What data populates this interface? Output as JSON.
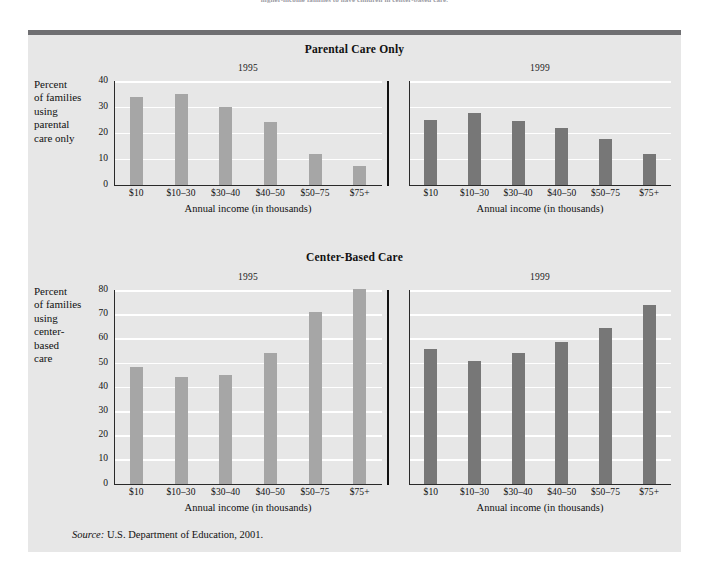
{
  "figure": {
    "top_caption": "higher-income families to have children in center-based care.",
    "source_prefix": "Source:",
    "source_text": "U.S. Department of Education, 2001."
  },
  "sections": [
    {
      "title": "Parental Care Only",
      "ylabel": "Percent\nof families\nusing\nparental\ncare only",
      "xlabel": "Annual income (in thousands)",
      "y_ticks": [
        "0",
        "10",
        "20",
        "30",
        "40"
      ],
      "panels": [
        {
          "year": "1995",
          "bar_color": "#a6a6a6"
        },
        {
          "year": "1999",
          "bar_color": "#777777"
        }
      ]
    },
    {
      "title": "Center-Based Care",
      "ylabel": "Percent\nof families\nusing\ncenter-\nbased\ncare",
      "xlabel": "Annual income (in thousands)",
      "y_ticks": [
        "0",
        "10",
        "20",
        "30",
        "40",
        "50",
        "60",
        "70",
        "80"
      ],
      "panels": [
        {
          "year": "1995",
          "bar_color": "#a6a6a6"
        },
        {
          "year": "1999",
          "bar_color": "#777777"
        }
      ]
    }
  ],
  "colors": {
    "panel_background": "#e7e7e7",
    "gridline": "#ffffff",
    "axis": "#2a2a2a",
    "bar_1995": "#a6a6a6",
    "bar_1999": "#777777",
    "rule_top": "#6f6f72"
  },
  "chart_data": [
    {
      "type": "bar",
      "title": "Parental Care Only",
      "subtitle": "1995",
      "xlabel": "Annual income (in thousands)",
      "ylabel": "Percent of families using parental care only",
      "categories": [
        "$10",
        "$10–30",
        "$30–40",
        "$40–50",
        "$50–75",
        "$75+"
      ],
      "values": [
        34,
        35,
        30,
        24,
        12,
        7
      ],
      "ylim": [
        0,
        40
      ],
      "ytick_step": 10,
      "grid": true,
      "legend": "none",
      "bar_color": "#a6a6a6"
    },
    {
      "type": "bar",
      "title": "Parental Care Only",
      "subtitle": "1999",
      "xlabel": "Annual income (in thousands)",
      "ylabel": "Percent of families using parental care only",
      "categories": [
        "$10",
        "$10–30",
        "$30–40",
        "$40–50",
        "$50–75",
        "$75+"
      ],
      "values": [
        25,
        27.5,
        24.5,
        22,
        17.5,
        12
      ],
      "ylim": [
        0,
        40
      ],
      "ytick_step": 10,
      "grid": true,
      "legend": "none",
      "bar_color": "#777777"
    },
    {
      "type": "bar",
      "title": "Center-Based Care",
      "subtitle": "1995",
      "xlabel": "Annual income (in thousands)",
      "ylabel": "Percent of families using center-based care",
      "categories": [
        "$10",
        "$10–30",
        "$30–40",
        "$40–50",
        "$50–75",
        "$75+"
      ],
      "values": [
        48,
        44,
        45,
        54,
        71,
        80.5
      ],
      "ylim": [
        0,
        80
      ],
      "ytick_step": 10,
      "grid": true,
      "legend": "none",
      "bar_color": "#a6a6a6"
    },
    {
      "type": "bar",
      "title": "Center-Based Care",
      "subtitle": "1999",
      "xlabel": "Annual income (in thousands)",
      "ylabel": "Percent of families using center-based care",
      "categories": [
        "$10",
        "$10–30",
        "$30–40",
        "$40–50",
        "$50–75",
        "$75+"
      ],
      "values": [
        55.5,
        50.5,
        54,
        58.5,
        64.5,
        74
      ],
      "ylim": [
        0,
        80
      ],
      "ytick_step": 10,
      "grid": true,
      "legend": "none",
      "bar_color": "#777777"
    }
  ]
}
